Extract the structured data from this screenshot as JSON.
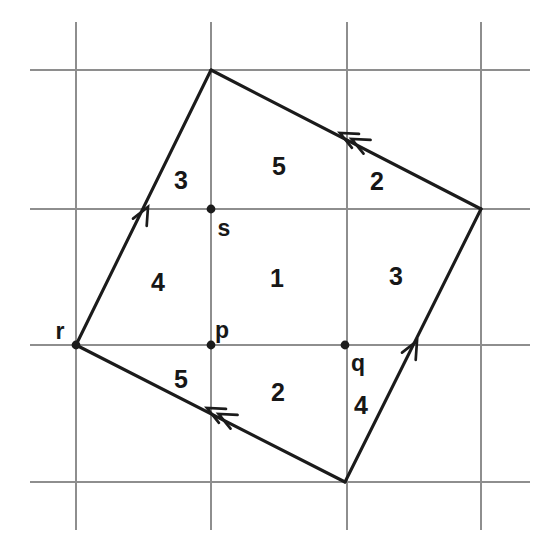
{
  "figure": {
    "canvas": {
      "width": 555,
      "height": 556
    },
    "colors": {
      "background": "#ffffff",
      "grid": "#8e8e8e",
      "ink": "#1b1b1b",
      "label": "#171717"
    },
    "grid": {
      "vertical_x": [
        76,
        211,
        347,
        481
      ],
      "horizontal_y": [
        70,
        209,
        345,
        482
      ],
      "vertical_span": {
        "y1": 22,
        "y2": 530
      },
      "horizontal_span": {
        "x1": 30,
        "x2": 530
      }
    },
    "quadrilateral": {
      "vertices": [
        {
          "name": "top",
          "x": 211,
          "y": 70
        },
        {
          "name": "right",
          "x": 481,
          "y": 209
        },
        {
          "name": "bottom",
          "x": 345,
          "y": 482
        },
        {
          "name": "left",
          "x": 76,
          "y": 345
        }
      ],
      "edges": [
        {
          "name": "edge-left-to-top",
          "from": "left",
          "to": "top",
          "arrow_count": 1,
          "arrow_at": {
            "x": 148,
            "y": 207
          },
          "direction_deg": -62
        },
        {
          "name": "edge-right-to-top",
          "from": "right",
          "to": "top",
          "arrow_count": 2,
          "arrow_at": {
            "x": 340,
            "y": 133
          },
          "direction_deg": -153
        },
        {
          "name": "edge-bottom-to-right",
          "from": "bottom",
          "to": "right",
          "arrow_count": 1,
          "arrow_at": {
            "x": 417,
            "y": 341
          },
          "direction_deg": -62
        },
        {
          "name": "edge-bottom-to-left",
          "from": "bottom",
          "to": "left",
          "arrow_count": 2,
          "arrow_at": {
            "x": 207,
            "y": 408
          },
          "direction_deg": -153
        }
      ]
    },
    "points": [
      {
        "id": "r",
        "label": "r",
        "x": 76,
        "y": 345,
        "label_x": 60,
        "label_y": 331
      },
      {
        "id": "p",
        "label": "p",
        "x": 211,
        "y": 345,
        "label_x": 222,
        "label_y": 330
      },
      {
        "id": "q",
        "label": "q",
        "x": 345,
        "y": 345,
        "label_x": 358,
        "label_y": 363
      },
      {
        "id": "s",
        "label": "s",
        "x": 211,
        "y": 209,
        "label_x": 224,
        "label_y": 228
      }
    ],
    "region_labels": [
      {
        "id": "region-3-upper-left",
        "text": "3",
        "x": 181,
        "y": 180
      },
      {
        "id": "region-5-upper-middle",
        "text": "5",
        "x": 279,
        "y": 166
      },
      {
        "id": "region-2-upper-right",
        "text": "2",
        "x": 377,
        "y": 181
      },
      {
        "id": "region-4-middle-left",
        "text": "4",
        "x": 158,
        "y": 282
      },
      {
        "id": "region-1-center",
        "text": "1",
        "x": 277,
        "y": 278
      },
      {
        "id": "region-3-middle-right",
        "text": "3",
        "x": 396,
        "y": 276
      },
      {
        "id": "region-5-lower-left",
        "text": "5",
        "x": 181,
        "y": 379
      },
      {
        "id": "region-2-lower-middle",
        "text": "2",
        "x": 278,
        "y": 392
      },
      {
        "id": "region-4-lower-right",
        "text": "4",
        "x": 361,
        "y": 405
      }
    ]
  }
}
